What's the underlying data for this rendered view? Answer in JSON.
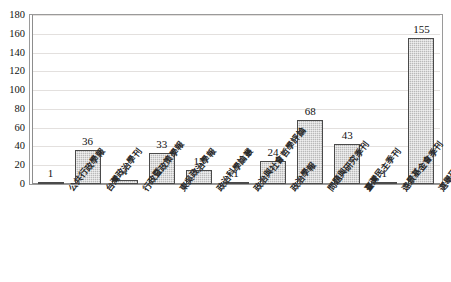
{
  "chart_data": {
    "type": "bar",
    "title": "",
    "xlabel": "",
    "ylabel": "",
    "ylim": [
      0,
      180
    ],
    "ytick_step": 20,
    "yticks": [
      180,
      160,
      140,
      120,
      100,
      80,
      60,
      40,
      20,
      0
    ],
    "grid": true,
    "legend": "none",
    "categories": [
      "公共行政學報",
      "台灣政治學刊",
      "行政暨政策學報",
      "東吳政治學報",
      "政治科學論叢",
      "政治與社會哲學評論",
      "政治學報",
      "問題與研究季刊",
      "臺灣民主季刊",
      "遠景基金會季刊",
      "選舉研究"
    ],
    "values": [
      1,
      36,
      4,
      33,
      15,
      1,
      24,
      68,
      43,
      1,
      155
    ],
    "value_labels": [
      "1",
      "36",
      "4",
      "33",
      "15",
      "1",
      "24",
      "68",
      "43",
      "1",
      "155"
    ],
    "bar_fill_color": "#b9b9b9",
    "bar_border_color": "#4a4a4a",
    "gridline_color": "#e3e0de",
    "frame_color": "#9a9a9a",
    "background_color": "#ffffff"
  }
}
